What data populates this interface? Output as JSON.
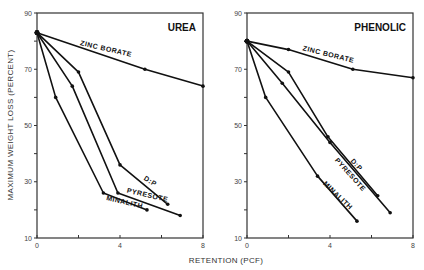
{
  "ylabel": "MAXIMUM WEIGHT LOSS (PERCENT)",
  "xlabel": "RETENTION (PCF)",
  "chart_data": [
    {
      "type": "line",
      "title": "UREA",
      "xlabel": "RETENTION (PCF)",
      "ylabel": "MAXIMUM WEIGHT LOSS (PERCENT)",
      "xlim": [
        0,
        8
      ],
      "ylim": [
        10,
        90
      ],
      "x_ticks": [
        0,
        2,
        4,
        6,
        8
      ],
      "x_tick_labels": [
        "0",
        "",
        "4",
        "",
        "8"
      ],
      "y_ticks": [
        10,
        20,
        30,
        40,
        50,
        60,
        70,
        80,
        90
      ],
      "y_tick_labels": [
        "10",
        "",
        "30",
        "",
        "50",
        "",
        "70",
        "",
        "90"
      ],
      "grid": false,
      "series": [
        {
          "name": "ZINC BORATE",
          "x": [
            0,
            5.2,
            8.0
          ],
          "y": [
            83,
            70,
            64
          ]
        },
        {
          "name": "D:P",
          "x": [
            0,
            2.0,
            4.0,
            6.3
          ],
          "y": [
            83,
            69,
            36,
            22
          ]
        },
        {
          "name": "PYRESOTE",
          "x": [
            0,
            1.7,
            3.9,
            6.9
          ],
          "y": [
            83,
            64,
            26,
            18
          ]
        },
        {
          "name": "MINALITH",
          "x": [
            0,
            0.9,
            3.2,
            5.3
          ],
          "y": [
            83,
            60,
            26,
            20
          ]
        }
      ]
    },
    {
      "type": "line",
      "title": "PHENOLIC",
      "xlabel": "RETENTION (PCF)",
      "ylabel": "MAXIMUM WEIGHT LOSS (PERCENT)",
      "xlim": [
        0,
        8
      ],
      "ylim": [
        10,
        90
      ],
      "x_ticks": [
        0,
        2,
        4,
        6,
        8
      ],
      "x_tick_labels": [
        "0",
        "",
        "4",
        "",
        "8"
      ],
      "y_ticks": [
        10,
        20,
        30,
        40,
        50,
        60,
        70,
        80,
        90
      ],
      "y_tick_labels": [
        "10",
        "",
        "30",
        "",
        "50",
        "",
        "70",
        "",
        "90"
      ],
      "grid": false,
      "series": [
        {
          "name": "ZINC BORATE",
          "x": [
            0,
            2.0,
            5.1,
            8.0
          ],
          "y": [
            80,
            77,
            70,
            67
          ]
        },
        {
          "name": "D:P",
          "x": [
            0,
            2.0,
            3.9,
            6.3
          ],
          "y": [
            80,
            69,
            46,
            25
          ]
        },
        {
          "name": "PYRESOTE",
          "x": [
            0,
            1.7,
            4.0,
            6.9
          ],
          "y": [
            80,
            65,
            44,
            19
          ]
        },
        {
          "name": "MINALITH",
          "x": [
            0,
            0.9,
            3.4,
            5.3
          ],
          "y": [
            80,
            60,
            32,
            16
          ]
        }
      ]
    }
  ],
  "labels": {
    "urea": [
      {
        "series": "ZINC BORATE",
        "x": 3.3,
        "y": 76.5,
        "angle": 13
      },
      {
        "series": "D:P",
        "x": 5.4,
        "y": 29.5,
        "angle": 32
      },
      {
        "series": "PYRESOTE",
        "x": 5.3,
        "y": 24.5,
        "angle": 13
      },
      {
        "series": "MINALITH",
        "x": 4.2,
        "y": 22.0,
        "angle": 13
      }
    ],
    "phenolic": [
      {
        "series": "ZINC BORATE",
        "x": 3.9,
        "y": 74.5,
        "angle": 14
      },
      {
        "series": "D:P",
        "x": 5.2,
        "y": 35.5,
        "angle": 48
      },
      {
        "series": "PYRESOTE",
        "x": 4.9,
        "y": 32.0,
        "angle": 48
      },
      {
        "series": "MINALITH",
        "x": 4.3,
        "y": 24.5,
        "angle": 44
      }
    ]
  }
}
